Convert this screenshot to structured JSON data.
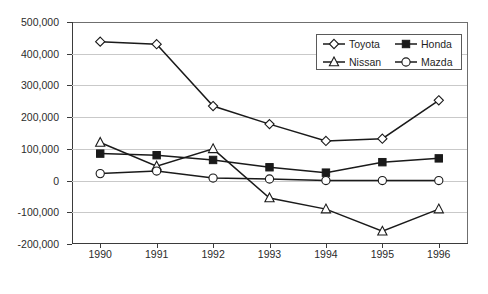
{
  "chart_data": {
    "type": "line",
    "title": "",
    "xlabel": "",
    "ylabel": "",
    "categories": [
      "1990",
      "1991",
      "1992",
      "1993",
      "1994",
      "1995",
      "1996"
    ],
    "ylim": [
      -200000,
      500000
    ],
    "ytick_step": 100000,
    "ytick_labels": [
      "500,000",
      "400,000",
      "300,000",
      "200,000",
      "100,000",
      "0",
      "-100,000",
      "-200,000"
    ],
    "ytick_values": [
      500000,
      400000,
      300000,
      200000,
      100000,
      0,
      -100000,
      -200000
    ],
    "grid": true,
    "grid_axis": "y",
    "legend_position": "top-right-inside",
    "series": [
      {
        "name": "Toyota",
        "marker": "diamond-open",
        "color": "#1a1a1a",
        "values": [
          438000,
          430000,
          235000,
          178000,
          125000,
          132000,
          253000
        ]
      },
      {
        "name": "Honda",
        "marker": "square-filled",
        "color": "#1a1a1a",
        "values": [
          85000,
          80000,
          65000,
          42000,
          25000,
          58000,
          70000
        ]
      },
      {
        "name": "Nissan",
        "marker": "triangle-open",
        "color": "#1a1a1a",
        "values": [
          120000,
          45000,
          100000,
          -55000,
          -90000,
          -160000,
          -90000
        ]
      },
      {
        "name": "Mazda",
        "marker": "circle-open",
        "color": "#1a1a1a",
        "values": [
          22000,
          30000,
          8000,
          5000,
          0,
          0,
          0
        ]
      }
    ]
  },
  "legend": {
    "items": [
      {
        "label": "Toyota",
        "marker": "diamond-open"
      },
      {
        "label": "Honda",
        "marker": "square-filled"
      },
      {
        "label": "Nissan",
        "marker": "triangle-open"
      },
      {
        "label": "Mazda",
        "marker": "circle-open"
      }
    ]
  },
  "colors": {
    "line": "#1a1a1a",
    "grid": "#c9c9c9",
    "axis": "#3b3b3b",
    "text": "#2b2b2b",
    "background": "#ffffff"
  }
}
